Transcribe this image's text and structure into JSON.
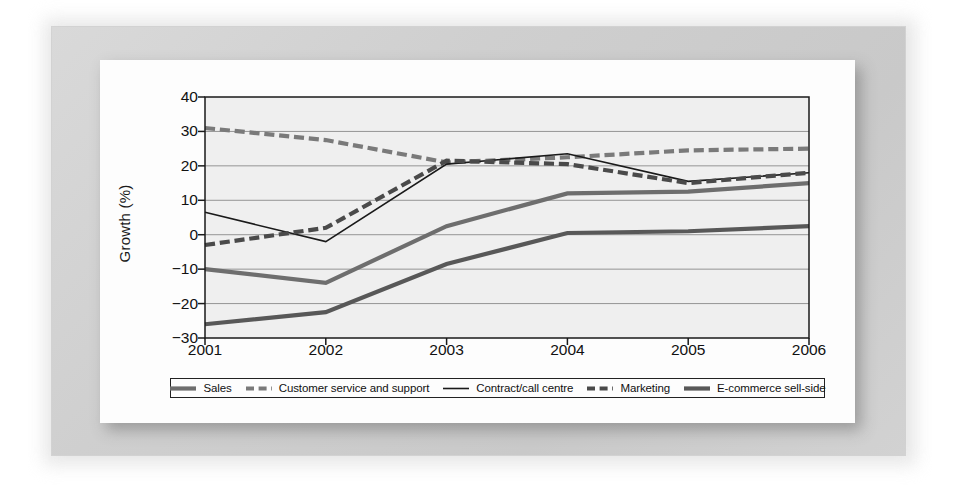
{
  "chart_data": {
    "type": "line",
    "title": "",
    "xlabel": "",
    "ylabel": "Growth (%)",
    "categories": [
      "2001",
      "2002",
      "2003",
      "2004",
      "2005",
      "2006"
    ],
    "x": [
      2001,
      2002,
      2003,
      2004,
      2005,
      2006
    ],
    "xlim": [
      2001,
      2006
    ],
    "ylim": [
      -30,
      40
    ],
    "yticks": [
      40,
      30,
      20,
      10,
      0,
      -10,
      -20,
      -30
    ],
    "ytick_labels": [
      "40",
      "30",
      "20",
      "10",
      "0",
      "−10",
      "−20",
      "−30"
    ],
    "grid": true,
    "grid_axis": "y",
    "legend_position": "bottom",
    "series": [
      {
        "name": "Sales",
        "values": [
          -10,
          -14,
          2.5,
          12,
          12.5,
          15
        ],
        "color": "#6e6e6e",
        "style": "solid",
        "width": 4.2
      },
      {
        "name": "Customer service and support",
        "values": [
          31,
          27.5,
          21,
          22.5,
          24.5,
          25
        ],
        "color": "#7a7a7a",
        "style": "dashed",
        "width": 4.2
      },
      {
        "name": "Contract/call centre",
        "values": [
          6.5,
          -2,
          20.5,
          23.5,
          15.5,
          18
        ],
        "color": "#1a1a1a",
        "style": "solid",
        "width": 1.6
      },
      {
        "name": "Marketing",
        "values": [
          -3,
          2,
          21.5,
          20.5,
          15,
          18
        ],
        "color": "#4a4a4a",
        "style": "dashed",
        "width": 4.2
      },
      {
        "name": "E-commerce sell-side",
        "values": [
          -26,
          -22.5,
          -8.5,
          0.5,
          1,
          2.5
        ],
        "color": "#585858",
        "style": "solid",
        "width": 4.2
      }
    ]
  },
  "axis": {
    "y_title": "Growth (%)"
  },
  "legend": {
    "items": [
      {
        "label": "Sales"
      },
      {
        "label": "Customer service and support"
      },
      {
        "label": "Contract/call centre"
      },
      {
        "label": "Marketing"
      },
      {
        "label": "E-commerce sell-side"
      }
    ]
  },
  "colors": {
    "page_background": "#ffffff",
    "mat": "#d2d2d2",
    "card": "#fdfdfd",
    "plot_background": "#efefef",
    "axis": "#1a1a1a",
    "grid": "#8a8a8a"
  }
}
